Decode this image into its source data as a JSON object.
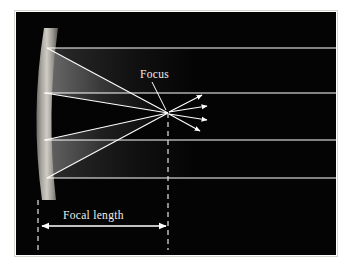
{
  "figure": {
    "background_color": "#ffffff",
    "panel_color": "#000000",
    "ray_color": "#ffffff",
    "mirror_color": "#b9b6b0",
    "label_color": "#f2f0ec"
  },
  "labels": {
    "focus": "Focus",
    "focal_length": "Focal length"
  },
  "diagram_data": {
    "type": "optics-ray-diagram",
    "element": "concave mirror",
    "focus_point": {
      "x": 168,
      "y": 113
    },
    "mirror": {
      "vertex_x": 44,
      "top_y": 28,
      "bottom_y": 200,
      "curvature": "concave, bulging left"
    },
    "incoming_rays": [
      {
        "id": "ray-1",
        "y": 48,
        "from_x": 352,
        "to_x": 44
      },
      {
        "id": "ray-2",
        "y": 93,
        "from_x": 352,
        "to_x": 44
      },
      {
        "id": "ray-3",
        "y": 140,
        "from_x": 352,
        "to_x": 44
      },
      {
        "id": "ray-4",
        "y": 178,
        "from_x": 352,
        "to_x": 44
      }
    ],
    "reflected_rays": [
      {
        "id": "reflect-1",
        "from_x": 46,
        "from_y": 48,
        "to_x": 168,
        "to_y": 113
      },
      {
        "id": "reflect-2",
        "from_x": 46,
        "from_y": 93,
        "to_x": 168,
        "to_y": 113
      },
      {
        "id": "reflect-3",
        "from_x": 46,
        "from_y": 140,
        "to_x": 168,
        "to_y": 113
      },
      {
        "id": "reflect-4",
        "from_x": 46,
        "from_y": 178,
        "to_x": 168,
        "to_y": 113
      }
    ],
    "diverging_rays": [
      {
        "id": "diverge-1",
        "to_x": 204,
        "to_y": 94
      },
      {
        "id": "diverge-2",
        "to_x": 209,
        "to_y": 106
      },
      {
        "id": "diverge-3",
        "to_x": 209,
        "to_y": 120
      },
      {
        "id": "diverge-4",
        "to_x": 202,
        "to_y": 132
      }
    ],
    "dashed_lines": [
      {
        "id": "mirror-vertex-dashed",
        "x": 38,
        "y1": 200,
        "y2": 252
      },
      {
        "id": "focus-dashed",
        "x": 168,
        "y1": 113,
        "y2": 252
      }
    ],
    "dimension_arrow": {
      "id": "focal-length-arrow",
      "y": 226,
      "x1": 40,
      "x2": 167,
      "double_headed": true
    },
    "focus_leader_line": {
      "from_x": 152,
      "from_y": 80,
      "to_x": 167,
      "to_y": 110
    }
  }
}
